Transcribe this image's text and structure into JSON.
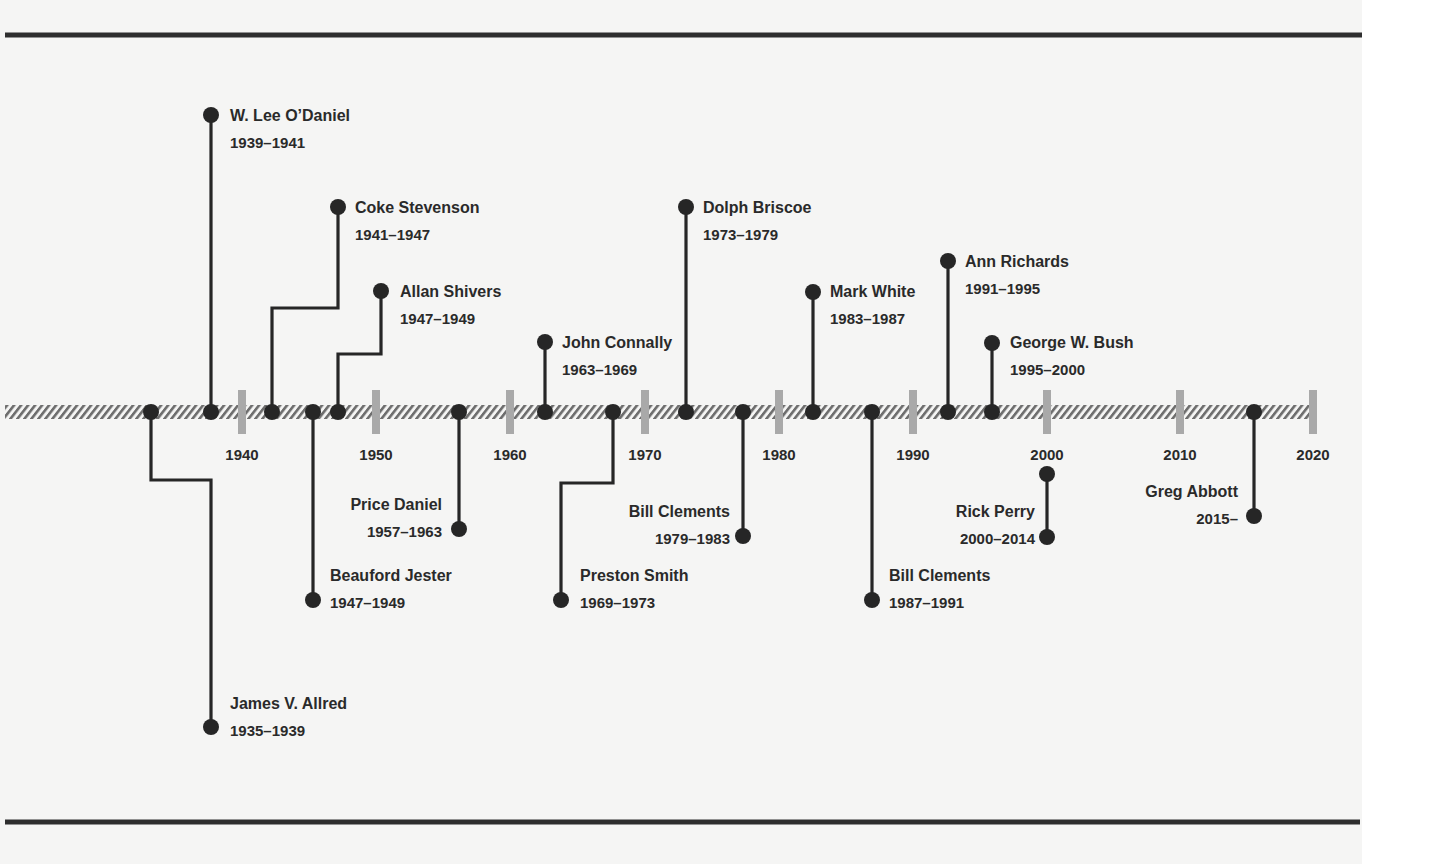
{
  "colors": {
    "ink": "#262626",
    "tick": "#a9a9a9",
    "hatch": "#6e6e6e",
    "paper": "#f5f5f4"
  },
  "axis": {
    "y": 412,
    "x_start": 5,
    "x_end": 1313,
    "ticks": [
      {
        "label": "1940",
        "x": 242
      },
      {
        "label": "1950",
        "x": 376
      },
      {
        "label": "1960",
        "x": 510
      },
      {
        "label": "1970",
        "x": 645
      },
      {
        "label": "1980",
        "x": 779
      },
      {
        "label": "1990",
        "x": 913
      },
      {
        "label": "2000",
        "x": 1047
      },
      {
        "label": "2010",
        "x": 1180
      },
      {
        "label": "2020",
        "x": 1313
      }
    ]
  },
  "governors": [
    {
      "name": "James V. Allred",
      "years": "1935–1939",
      "side": "below",
      "path": [
        [
          151,
          412
        ],
        [
          151,
          480
        ],
        [
          211,
          480
        ],
        [
          211,
          727
        ]
      ],
      "label_x": 230,
      "label_y": 703,
      "anchor": "start"
    },
    {
      "name": "W. Lee O’Daniel",
      "years": "1939–1941",
      "side": "above",
      "path": [
        [
          211,
          412
        ],
        [
          211,
          115
        ]
      ],
      "label_x": 230,
      "label_y": 115,
      "anchor": "start"
    },
    {
      "name": "Coke Stevenson",
      "years": "1941–1947",
      "side": "above",
      "path": [
        [
          272,
          412
        ],
        [
          272,
          308
        ],
        [
          338,
          308
        ],
        [
          338,
          207
        ]
      ],
      "label_x": 355,
      "label_y": 207,
      "anchor": "start"
    },
    {
      "name": "Beauford Jester",
      "years": "1947–1949",
      "side": "below",
      "path": [
        [
          313,
          412
        ],
        [
          313,
          600
        ]
      ],
      "label_x": 330,
      "label_y": 575,
      "anchor": "start"
    },
    {
      "name": "Allan Shivers",
      "years": "1947–1949",
      "side": "above",
      "path": [
        [
          338,
          412
        ],
        [
          338,
          354
        ],
        [
          381,
          354
        ],
        [
          381,
          291
        ]
      ],
      "label_x": 400,
      "label_y": 291,
      "anchor": "start"
    },
    {
      "name": "Price Daniel",
      "years": "1957–1963",
      "side": "below",
      "path": [
        [
          459,
          412
        ],
        [
          459,
          529
        ]
      ],
      "label_x": 442,
      "label_y": 504,
      "anchor": "end"
    },
    {
      "name": "John Connally",
      "years": "1963–1969",
      "side": "above",
      "path": [
        [
          545,
          412
        ],
        [
          545,
          342
        ]
      ],
      "label_x": 562,
      "label_y": 342,
      "anchor": "start"
    },
    {
      "name": "Preston Smith",
      "years": "1969–1973",
      "side": "below",
      "path": [
        [
          613,
          412
        ],
        [
          613,
          483
        ],
        [
          561,
          483
        ],
        [
          561,
          600
        ]
      ],
      "label_x": 580,
      "label_y": 575,
      "anchor": "start"
    },
    {
      "name": "Dolph Briscoe",
      "years": "1973–1979",
      "side": "above",
      "path": [
        [
          686,
          412
        ],
        [
          686,
          207
        ]
      ],
      "label_x": 703,
      "label_y": 207,
      "anchor": "start"
    },
    {
      "name": "Bill Clements",
      "years": "1979–1983",
      "side": "below",
      "path": [
        [
          743,
          412
        ],
        [
          743,
          536
        ]
      ],
      "label_x": 730,
      "label_y": 511,
      "anchor": "end"
    },
    {
      "name": "Mark White",
      "years": "1983–1987",
      "side": "above",
      "path": [
        [
          813,
          412
        ],
        [
          813,
          292
        ]
      ],
      "label_x": 830,
      "label_y": 291,
      "anchor": "start"
    },
    {
      "name": "Bill Clements",
      "years": "1987–1991",
      "side": "below",
      "path": [
        [
          872,
          412
        ],
        [
          872,
          600
        ]
      ],
      "label_x": 889,
      "label_y": 575,
      "anchor": "start"
    },
    {
      "name": "Ann Richards",
      "years": "1991–1995",
      "side": "above",
      "path": [
        [
          948,
          412
        ],
        [
          948,
          261
        ]
      ],
      "label_x": 965,
      "label_y": 261,
      "anchor": "start"
    },
    {
      "name": "George W. Bush",
      "years": "1995–2000",
      "side": "above",
      "path": [
        [
          992,
          412
        ],
        [
          992,
          343
        ]
      ],
      "label_x": 1010,
      "label_y": 342,
      "anchor": "start"
    },
    {
      "name": "Rick Perry",
      "years": "2000–2014",
      "side": "below",
      "path": [
        [
          1047,
          474
        ],
        [
          1047,
          537
        ]
      ],
      "label_x": 1035,
      "label_y": 511,
      "anchor": "end",
      "both_ends_dotted": true
    },
    {
      "name": "Greg Abbott",
      "years": "2015–",
      "side": "below",
      "path": [
        [
          1254,
          412
        ],
        [
          1254,
          516
        ]
      ],
      "label_x": 1238,
      "label_y": 491,
      "anchor": "end"
    }
  ],
  "rules": {
    "top": {
      "y": 35,
      "x1": 5,
      "x2": 1362
    },
    "bottom": {
      "y": 822,
      "x1": 5,
      "x2": 1360
    }
  }
}
